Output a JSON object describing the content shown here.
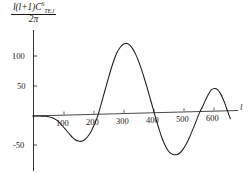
{
  "chart_data": {
    "type": "line",
    "title": "",
    "subtitle": "",
    "ylabel_parts": {
      "numerator_prefix": "l",
      "numerator_paren": "(l+1)",
      "numerator_symbol": "C",
      "numerator_superscript": "S",
      "numerator_subscript": "TE,l",
      "denominator": "2π"
    },
    "ylabel_text": "l(l+1)C^S_{TE,l} / 2π",
    "xlabel": "l",
    "x_ticks": [
      100,
      200,
      300,
      400,
      500,
      600
    ],
    "x_tick_labels": [
      "100",
      "200",
      "300",
      "400",
      "500",
      "600"
    ],
    "y_ticks": [
      -50,
      50,
      100
    ],
    "y_tick_labels": [
      "-50",
      "50",
      "100"
    ],
    "xlim": [
      0,
      660
    ],
    "ylim": [
      -85,
      130
    ],
    "grid": false,
    "legend": null,
    "series": [
      {
        "name": "TE cross power spectrum",
        "color": "#1a1a1a",
        "points": [
          [
            2,
            0
          ],
          [
            10,
            0
          ],
          [
            20,
            -0.3
          ],
          [
            30,
            -0.6
          ],
          [
            40,
            -1
          ],
          [
            50,
            -2
          ],
          [
            60,
            -3.5
          ],
          [
            70,
            -5.5
          ],
          [
            80,
            -9
          ],
          [
            90,
            -14
          ],
          [
            100,
            -20
          ],
          [
            110,
            -26
          ],
          [
            120,
            -32
          ],
          [
            130,
            -38
          ],
          [
            140,
            -42
          ],
          [
            150,
            -44.5
          ],
          [
            160,
            -45
          ],
          [
            170,
            -43
          ],
          [
            180,
            -38
          ],
          [
            190,
            -31
          ],
          [
            200,
            -21
          ],
          [
            210,
            -9
          ],
          [
            215,
            -2
          ],
          [
            220,
            6
          ],
          [
            230,
            24
          ],
          [
            240,
            42
          ],
          [
            250,
            60
          ],
          [
            260,
            77
          ],
          [
            270,
            92
          ],
          [
            280,
            104
          ],
          [
            290,
            112
          ],
          [
            300,
            117
          ],
          [
            310,
            118
          ],
          [
            320,
            116
          ],
          [
            330,
            110
          ],
          [
            340,
            101
          ],
          [
            350,
            89
          ],
          [
            360,
            75
          ],
          [
            370,
            59
          ],
          [
            380,
            42
          ],
          [
            390,
            24
          ],
          [
            400,
            6
          ],
          [
            405,
            -3
          ],
          [
            410,
            -12
          ],
          [
            420,
            -29
          ],
          [
            430,
            -44
          ],
          [
            440,
            -56
          ],
          [
            450,
            -65
          ],
          [
            460,
            -70
          ],
          [
            470,
            -72
          ],
          [
            480,
            -72
          ],
          [
            490,
            -69
          ],
          [
            500,
            -63
          ],
          [
            510,
            -55
          ],
          [
            520,
            -45
          ],
          [
            530,
            -33
          ],
          [
            540,
            -21
          ],
          [
            550,
            -8
          ],
          [
            557,
            0
          ],
          [
            565,
            8
          ],
          [
            575,
            19
          ],
          [
            585,
            29
          ],
          [
            595,
            36
          ],
          [
            605,
            38
          ],
          [
            615,
            36
          ],
          [
            625,
            29
          ],
          [
            635,
            18
          ],
          [
            645,
            4
          ],
          [
            652,
            -6
          ],
          [
            658,
            -14
          ]
        ],
        "features": {
          "first_trough": {
            "x": 155,
            "y": -45
          },
          "first_zero_crossing": 216,
          "main_peak": {
            "x": 310,
            "y": 118
          },
          "second_zero_crossing": 403,
          "second_trough": {
            "x": 475,
            "y": -72
          },
          "third_zero_crossing": 557,
          "third_peak": {
            "x": 603,
            "y": 38
          }
        }
      }
    ],
    "axis_color": "#1a1a1a",
    "background": "#ffffff"
  },
  "axes": {
    "x_axis_name": "l",
    "y_tick_100": "100",
    "y_tick_50": "50",
    "y_tick_neg50": "-50",
    "x_tick_100": "100",
    "x_tick_200": "200",
    "x_tick_300": "300",
    "x_tick_400": "400",
    "x_tick_500": "500",
    "x_tick_600": "600"
  },
  "ylabel": {
    "l_first": "l",
    "paren": "(l+1)",
    "C": "C",
    "sup": "S",
    "sub": "TE,l",
    "denominator": "2π"
  }
}
